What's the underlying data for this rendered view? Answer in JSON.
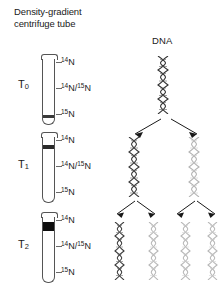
{
  "headers": {
    "left": "Density-gradient\ncentrifuge tube",
    "dna": "DNA"
  },
  "colors": {
    "ink": "#1a1a1a",
    "tube_outline": "#555555",
    "band_dark": "#0d0d0d",
    "band_mid": "#2a2a2a",
    "band_light": "#3a3a3a",
    "helix_dark": "#333333",
    "helix_light": "#b5b5b5",
    "background": "#ffffff"
  },
  "nitrogen_labels": {
    "light": "N",
    "light_sup": "14",
    "hybrid_sup_a": "14",
    "hybrid_mid": "N/",
    "hybrid_sup_b": "15",
    "hybrid_end": "N",
    "heavy_sup": "15",
    "heavy": "N"
  },
  "generations": [
    {
      "id": "t0",
      "time_label": "T",
      "time_sub": "0",
      "band_position": "heavy",
      "band_weight": "thin",
      "helix_count": 1,
      "helix_shades": [
        "dark"
      ],
      "arrow_count": 2
    },
    {
      "id": "t1",
      "time_label": "T",
      "time_sub": "1",
      "band_position": "hybrid",
      "band_weight": "med",
      "helix_count": 2,
      "helix_shades": [
        "dark",
        "light"
      ],
      "arrow_count": 4
    },
    {
      "id": "t2",
      "time_label": "T",
      "time_sub": "2",
      "band_position": "light",
      "band_weight": "thick",
      "helix_count": 4,
      "helix_shades": [
        "dark",
        "light",
        "light",
        "light"
      ],
      "arrow_count": 0
    }
  ]
}
